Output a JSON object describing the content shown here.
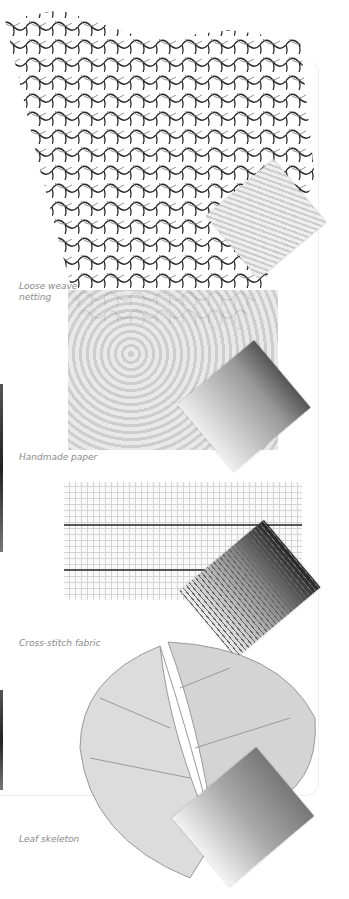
{
  "page": {
    "samples": [
      {
        "id": "netting",
        "caption_line1": "Loose weave",
        "caption_line2": "netting"
      },
      {
        "id": "paper",
        "caption_line1": "Handmade paper"
      },
      {
        "id": "cross-stitch",
        "caption_line1": "Cross-stitch fabric"
      },
      {
        "id": "leaf",
        "caption_line1": "Leaf skeleton"
      }
    ]
  },
  "colors": {
    "caption": "#8a8a8a",
    "ink": "#2a2a2a"
  }
}
